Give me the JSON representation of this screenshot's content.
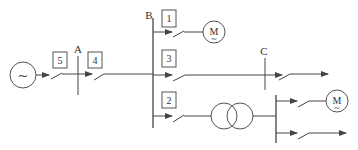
{
  "diagram": {
    "title": "",
    "source": {
      "symbol": "~"
    },
    "buses": {
      "A": {
        "label": "A"
      },
      "B": {
        "label": "B"
      },
      "C": {
        "label": "C"
      }
    },
    "boxes": {
      "b5": {
        "label": "5"
      },
      "b4": {
        "label": "4"
      },
      "b1": {
        "label": "1"
      },
      "b3": {
        "label": "3"
      },
      "b2": {
        "label": "2"
      }
    },
    "motors": {
      "m1": {
        "label": "M",
        "sub": "~"
      },
      "m2": {
        "label": "M",
        "sub": "~"
      }
    },
    "colors": {
      "line": "#444444",
      "background": "#ffffff"
    }
  }
}
